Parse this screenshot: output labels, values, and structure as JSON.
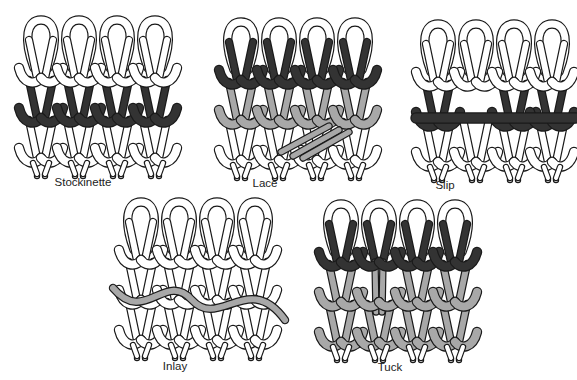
{
  "figure": {
    "colors": {
      "outline": "#1a1a1a",
      "white": "#ffffff",
      "dark": "#333333",
      "gray": "#a8a8a8"
    },
    "swatches": [
      {
        "id": "stockinette",
        "label": "Stockinette",
        "x": 15,
        "y": 18,
        "label_x": 83,
        "label_y": 176,
        "rows": [
          "white",
          "dark",
          "white"
        ],
        "feature": "none"
      },
      {
        "id": "lace",
        "label": "Lace",
        "x": 215,
        "y": 20,
        "label_x": 265,
        "label_y": 177,
        "rows": [
          "dark",
          "gray",
          "white"
        ],
        "feature": "transfer"
      },
      {
        "id": "slip",
        "label": "Slip",
        "x": 412,
        "y": 22,
        "label_x": 445,
        "label_y": 179,
        "rows": [
          "white",
          "dark",
          "white"
        ],
        "feature": "float"
      },
      {
        "id": "inlay",
        "label": "Inlay",
        "x": 115,
        "y": 200,
        "label_x": 175,
        "label_y": 360,
        "rows": [
          "white",
          "white",
          "white"
        ],
        "feature": "inlay"
      },
      {
        "id": "tuck",
        "label": "Tuck",
        "x": 315,
        "y": 202,
        "label_x": 390,
        "label_y": 361,
        "rows": [
          "dark",
          "gray",
          "gray"
        ],
        "feature": "tuck"
      }
    ]
  }
}
